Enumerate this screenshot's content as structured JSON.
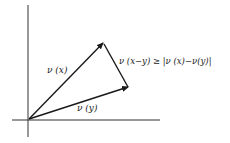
{
  "diagram": {
    "type": "vector-diagram",
    "labels": {
      "nu_x": "ν (x)",
      "nu_y": "ν (y)",
      "inequality": "ν (x−y) ≥ |ν (x)−ν(y)|"
    },
    "vectors": [
      {
        "name": "ν(x)",
        "from": [
          29,
          119
        ],
        "to": [
          103,
          43
        ]
      },
      {
        "name": "ν(y)",
        "from": [
          29,
          119
        ],
        "to": [
          128,
          87
        ]
      },
      {
        "name": "ν(x−y)",
        "from": [
          103,
          43
        ],
        "to": [
          128,
          87
        ]
      }
    ],
    "colors": {
      "stroke": "#1a1a1a",
      "background": "#ffffff"
    }
  }
}
